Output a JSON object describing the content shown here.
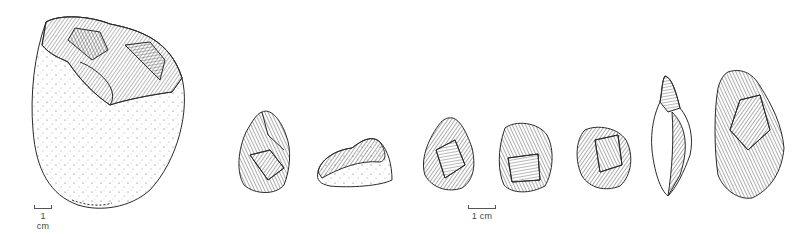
{
  "figure": {
    "background": "#ffffff",
    "ink_color": "#2a2a2a",
    "artifacts": [
      {
        "id": "core-large",
        "type": "pebble core / chopper",
        "has_cortex_stipple": true
      },
      {
        "id": "flake-tool-1",
        "type": "retouched flake"
      },
      {
        "id": "flake-tool-2",
        "type": "flake with cortex",
        "has_cortex_stipple": true
      },
      {
        "id": "flake-tool-3",
        "type": "point / triangular flake"
      },
      {
        "id": "flake-tool-4",
        "type": "retouched flake"
      },
      {
        "id": "flake-tool-5",
        "type": "discoid scraper"
      },
      {
        "id": "flake-tool-6",
        "type": "borer / awl"
      },
      {
        "id": "flake-tool-7",
        "type": "side scraper"
      }
    ],
    "scale_bars": [
      {
        "label": "1 cm",
        "applies_to": "core-large"
      },
      {
        "label": "1 cm",
        "applies_to": "small artifacts"
      }
    ]
  }
}
